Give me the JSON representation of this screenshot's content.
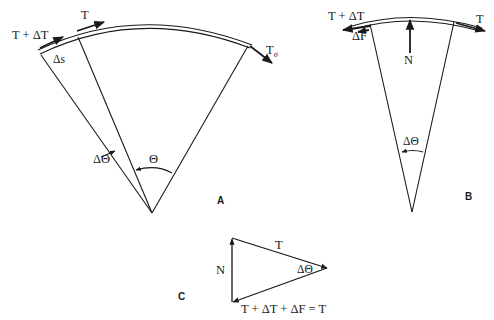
{
  "figure": {
    "panels": [
      {
        "id": "A",
        "letter": "A",
        "labels": {
          "tension_plus": "T + ΔT",
          "tension": "T",
          "tension_sigma_base": "T",
          "tension_sigma_sub": "σ",
          "arc_length": "Δs",
          "delta_theta": "ΔΘ",
          "theta": "Θ"
        }
      },
      {
        "id": "B",
        "letter": "B",
        "labels": {
          "tension_plus": "T + ΔT",
          "friction": "ΔF",
          "normal": "N",
          "tension": "T",
          "delta_theta": "ΔΘ"
        }
      },
      {
        "id": "C",
        "letter": "C",
        "labels": {
          "tension": "T",
          "normal": "N",
          "delta_theta": "ΔΘ",
          "equation": "T + ΔT + ΔF = T"
        }
      }
    ]
  },
  "colors": {
    "ink": "#1a1a1a",
    "background": "#ffffff"
  }
}
